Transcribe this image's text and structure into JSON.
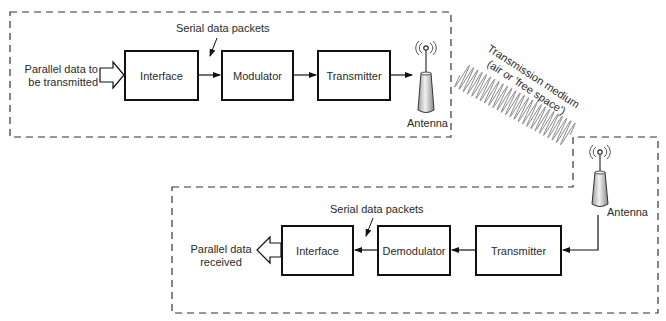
{
  "diagram": {
    "title": "",
    "transmitter_side": {
      "input_label": "Parallel data to be transmitted",
      "input_label_lines": [
        "Parallel data to",
        "be transmitted"
      ],
      "serial_label": "Serial data packets",
      "blocks": [
        "Interface",
        "Modulator",
        "Transmitter"
      ],
      "antenna_label": "Antenna"
    },
    "medium": {
      "label_line1": "Transmission medium",
      "label_line2": "(air or 'free space')"
    },
    "receiver_side": {
      "antenna_label": "Antenna",
      "blocks": [
        "Transmitter",
        "Demodulator",
        "Interface"
      ],
      "serial_label": "Serial data packets",
      "output_label_lines": [
        "Parallel data",
        "received"
      ]
    },
    "colors": {
      "line": "#111111",
      "dashed_border": "#333333",
      "text": "#2a2a2a",
      "antenna_fill": "#d8d8d8"
    }
  }
}
